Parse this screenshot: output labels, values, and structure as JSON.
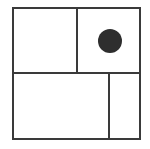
{
  "diagram": {
    "line_color": "#3a3a3a",
    "dot_color": "#2e2e2e",
    "background": "#ffffff",
    "outer": {
      "x": 13,
      "y": 8,
      "w": 127,
      "h": 131
    },
    "dividers": {
      "horizontal_y": 73,
      "top_vertical_x": 77,
      "bottom_vertical_x": 109
    },
    "cells": [
      {
        "id": "top-left",
        "has_dot": false
      },
      {
        "id": "top-right",
        "has_dot": true
      },
      {
        "id": "bottom-left",
        "has_dot": false
      },
      {
        "id": "bottom-right",
        "has_dot": false
      }
    ],
    "dot": {
      "cx": 110,
      "cy": 41,
      "r": 12
    }
  }
}
